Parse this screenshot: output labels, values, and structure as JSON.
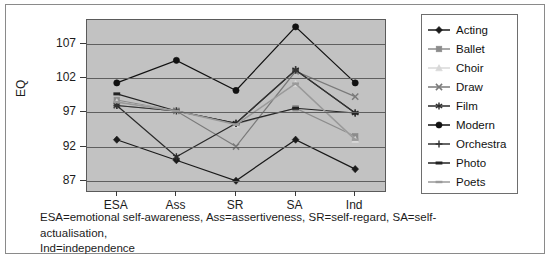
{
  "chart_data": {
    "type": "line",
    "title": "",
    "xlabel": "",
    "ylabel": "EQ",
    "categories": [
      "ESA",
      "Ass",
      "SR",
      "SA",
      "Ind"
    ],
    "yticks": [
      87,
      92,
      97,
      102,
      107
    ],
    "ylim": [
      85.5,
      110.5
    ],
    "grid": true,
    "legend_position": "right",
    "series": [
      {
        "name": "Acting",
        "marker": "diamond",
        "color": "#1a1a1a",
        "values": [
          93.0,
          90.0,
          87.0,
          93.0,
          88.7
        ]
      },
      {
        "name": "Ballet",
        "marker": "square",
        "color": "#8c8c8c",
        "values": [
          98.8,
          97.2,
          95.3,
          97.6,
          93.5
        ]
      },
      {
        "name": "Choir",
        "marker": "triangle",
        "color": "#d8d8d8",
        "values": [
          98.5,
          97.2,
          95.2,
          101.2,
          93.0
        ]
      },
      {
        "name": "Draw",
        "marker": "cross",
        "color": "#7a7a7a",
        "values": [
          98.0,
          97.2,
          92.0,
          103.0,
          99.3
        ]
      },
      {
        "name": "Film",
        "marker": "star",
        "color": "#2a2a2a",
        "values": [
          98.0,
          90.5,
          95.4,
          103.2,
          96.9
        ]
      },
      {
        "name": "Modern",
        "marker": "circle",
        "color": "#111111",
        "values": [
          101.3,
          104.6,
          100.2,
          109.5,
          101.3
        ]
      },
      {
        "name": "Orchestra",
        "marker": "plus",
        "color": "#333333",
        "values": [
          98.0,
          97.2,
          95.4,
          103.2,
          96.9
        ]
      },
      {
        "name": "Photo",
        "marker": "dash",
        "color": "#222222",
        "values": [
          99.7,
          97.2,
          95.4,
          97.6,
          96.9
        ]
      },
      {
        "name": "Poets",
        "marker": "line",
        "color": "#9a9a9a",
        "values": [
          98.5,
          97.2,
          95.2,
          101.2,
          93.0
        ]
      }
    ]
  },
  "axis": {
    "y_label": "EQ",
    "y_tick_labels": [
      "107",
      "102",
      "97",
      "92",
      "87"
    ],
    "x_tick_labels": [
      "ESA",
      "Ass",
      "SR",
      "SA",
      "Ind"
    ]
  },
  "legend": {
    "items": [
      {
        "label": "Acting"
      },
      {
        "label": "Ballet"
      },
      {
        "label": "Choir"
      },
      {
        "label": "Draw"
      },
      {
        "label": "Film"
      },
      {
        "label": "Modern"
      },
      {
        "label": "Orchestra"
      },
      {
        "label": "Photo"
      },
      {
        "label": "Poets"
      }
    ]
  },
  "caption": {
    "line1": "ESA=emotional self-awareness, Ass=assertiveness, SR=self-regard, SA=self-actualisation,",
    "line2": "Ind=independence"
  },
  "colors": {
    "plot_background": "#c2c2c2",
    "gridline": "#5f5f5f",
    "frame": "#8a8a8a",
    "text": "#1c1c1c"
  }
}
